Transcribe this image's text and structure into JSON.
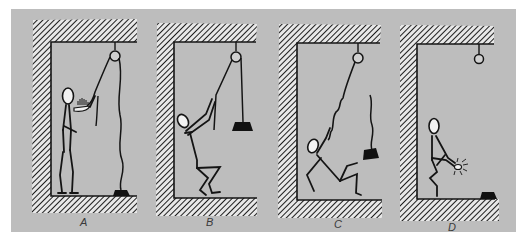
{
  "figure": {
    "background_color": "#bdbdbd",
    "line_color": "#141414",
    "hatch_color": "#1e1e1e",
    "panels": [
      {
        "id": "A",
        "label": "A",
        "description": "Person on floor pulls rope; weight rests on floor; rope slack",
        "person_pose": "standing",
        "weight_position": "floor",
        "hazard": "rope-burn on hands"
      },
      {
        "id": "B",
        "label": "B",
        "description": "Person pulls rope hand over hand; weight lifted and hanging from pulley",
        "person_pose": "crouching-pulling",
        "weight_position": "suspended"
      },
      {
        "id": "C",
        "label": "C",
        "description": "Person lifted off balance while weight falls; rope slack and wavy",
        "person_pose": "falling",
        "weight_position": "mid-air"
      },
      {
        "id": "D",
        "label": "D",
        "description": "Person holds injured hand; weight on floor; pulley empty",
        "person_pose": "crouching-injured",
        "weight_position": "floor"
      }
    ]
  }
}
